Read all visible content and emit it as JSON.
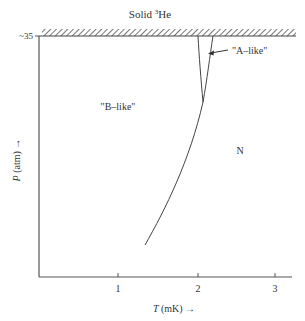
{
  "diagram": {
    "title_prefix": "Solid ",
    "title_sup": "3",
    "title_suffix": "He",
    "y_axis": {
      "label_var": "P",
      "label_unit": " (atm) ",
      "arrow": "→",
      "ticks": [
        {
          "label": "~35",
          "value": 35
        }
      ]
    },
    "x_axis": {
      "label_var": "T",
      "label_unit": " (mK) ",
      "arrow": "→",
      "ticks": [
        {
          "label": "1",
          "value": 1
        },
        {
          "label": "2",
          "value": 2
        },
        {
          "label": "3",
          "value": 3
        }
      ]
    },
    "regions": {
      "b_like": "\"B–like\"",
      "a_like": "\"A–like\"",
      "normal": "N"
    },
    "boundary_label": "Solid ³He (hatched melting line)",
    "line_color": "#444444",
    "text_color": "#333333"
  }
}
